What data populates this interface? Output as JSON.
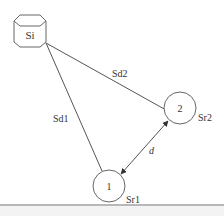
{
  "diagram": {
    "source_node": {
      "label": "Si",
      "shape": "hexagonal-prism",
      "cx": 30,
      "cy": 31
    },
    "nodes": [
      {
        "id": "1",
        "label": "1",
        "range_label": "Sr1",
        "cx": 109,
        "cy": 186,
        "r": 16
      },
      {
        "id": "2",
        "label": "2",
        "range_label": "Sr2",
        "cx": 180,
        "cy": 108,
        "r": 16
      }
    ],
    "edges": [
      {
        "from": "Si",
        "to": "1",
        "label": "Sd1",
        "type": "line"
      },
      {
        "from": "Si",
        "to": "2",
        "label": "Sd2",
        "type": "line"
      },
      {
        "from": "1",
        "to": "2",
        "label": "d",
        "type": "double-arrow"
      }
    ],
    "colors": {
      "stroke": "#555555",
      "text": "#333333",
      "background": "#ffffff",
      "bottom_rule": "#b8b8b8"
    }
  }
}
